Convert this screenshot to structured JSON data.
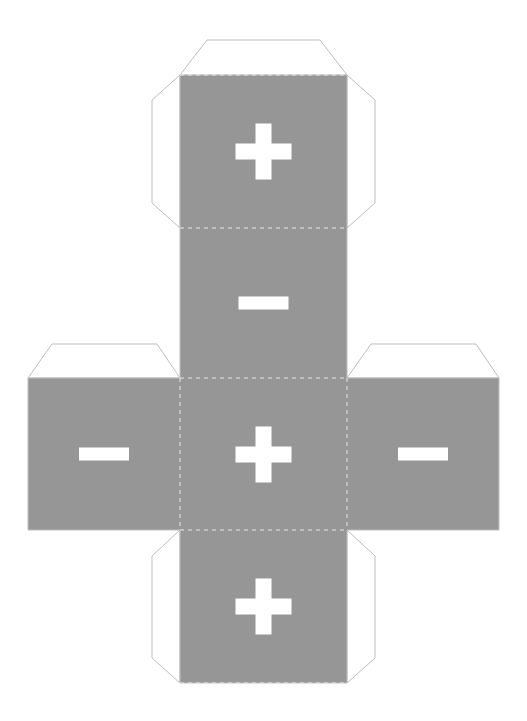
{
  "document": {
    "title": "Cube Net Template",
    "type": "printable-papercraft-cube-net",
    "background_color": "#ffffff"
  },
  "style": {
    "panel_fill": "#969696",
    "flap_fill": "#ffffff",
    "cut_line_color": "#bdbdbd",
    "fold_line_color": "#e8e8e8",
    "symbol_color": "#ffffff",
    "cut_line_width": 1,
    "fold_line_width": 1,
    "fold_dash": "4 4"
  },
  "watermark": {
    "text": "",
    "visible": true,
    "color": "#f4f4f4",
    "x": 263,
    "y": 60,
    "font_size": 9
  },
  "layout": {
    "canvas_width": 527,
    "canvas_height": 721,
    "column_left": 180,
    "column_right": 347,
    "row_top": 75,
    "row_fold_1": 228,
    "row_fold_2": 378,
    "row_fold_3": 530,
    "row_bottom": 683,
    "left_arm_x": 28,
    "right_arm_x": 499,
    "flap_depth": 43,
    "flap_inset": 27
  },
  "panels": [
    {
      "id": "panel-top",
      "name": "top-face",
      "symbol": "+",
      "symbol_name": "plus",
      "x": 180,
      "y": 75,
      "width": 167,
      "height": 153,
      "fill": "#969696"
    },
    {
      "id": "panel-upper-middle",
      "name": "upper-middle-face",
      "symbol": "–",
      "symbol_name": "minus",
      "x": 180,
      "y": 228,
      "width": 167,
      "height": 150,
      "fill": "#969696"
    },
    {
      "id": "panel-center",
      "name": "center-face",
      "symbol": "+",
      "symbol_name": "plus",
      "x": 180,
      "y": 378,
      "width": 167,
      "height": 152,
      "fill": "#969696"
    },
    {
      "id": "panel-bottom",
      "name": "bottom-face",
      "symbol": "+",
      "symbol_name": "plus",
      "x": 180,
      "y": 530,
      "width": 167,
      "height": 153,
      "fill": "#969696"
    },
    {
      "id": "panel-left",
      "name": "left-face",
      "symbol": "–",
      "symbol_name": "minus",
      "x": 28,
      "y": 378,
      "width": 152,
      "height": 152,
      "fill": "#969696"
    },
    {
      "id": "panel-right",
      "name": "right-face",
      "symbol": "–",
      "symbol_name": "minus",
      "x": 347,
      "y": 378,
      "width": 152,
      "height": 152,
      "fill": "#969696"
    }
  ],
  "symbols": {
    "plus": {
      "arm_length": 56,
      "arm_thickness": 16
    },
    "minus": {
      "arm_length": 50,
      "arm_thickness": 13
    }
  },
  "flaps": [
    {
      "id": "flap-top",
      "name": "top-glue-flap",
      "edge": "top"
    },
    {
      "id": "flap-upper-left",
      "name": "upper-left-glue-flap",
      "edge": "left"
    },
    {
      "id": "flap-upper-right",
      "name": "upper-right-glue-flap",
      "edge": "right"
    },
    {
      "id": "flap-left-top",
      "name": "left-arm-top-glue-flap",
      "edge": "top"
    },
    {
      "id": "flap-right-top",
      "name": "right-arm-top-glue-flap",
      "edge": "top"
    },
    {
      "id": "flap-bottom-left",
      "name": "bottom-left-glue-flap",
      "edge": "left"
    },
    {
      "id": "flap-bottom-right",
      "name": "bottom-right-glue-flap",
      "edge": "right"
    },
    {
      "id": "flap-bottom",
      "name": "bottom-glue-flap",
      "edge": "bottom"
    }
  ],
  "fold_lines": [
    {
      "id": "fold-h-1",
      "orientation": "horizontal",
      "x1": 180,
      "y1": 228,
      "x2": 347,
      "y2": 228
    },
    {
      "id": "fold-h-2",
      "orientation": "horizontal",
      "x1": 180,
      "y1": 378,
      "x2": 347,
      "y2": 378
    },
    {
      "id": "fold-h-3",
      "orientation": "horizontal",
      "x1": 180,
      "y1": 530,
      "x2": 347,
      "y2": 530
    },
    {
      "id": "fold-v-1",
      "orientation": "vertical",
      "x1": 180,
      "y1": 378,
      "x2": 180,
      "y2": 530
    },
    {
      "id": "fold-v-2",
      "orientation": "vertical",
      "x1": 347,
      "y1": 378,
      "x2": 347,
      "y2": 530
    }
  ]
}
